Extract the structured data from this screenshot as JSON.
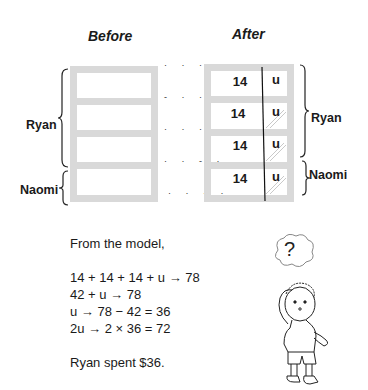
{
  "headings": {
    "before": "Before",
    "after": "After"
  },
  "before_model": {
    "labels": {
      "ryan": "Ryan",
      "naomi": "Naomi"
    },
    "unit_count": 4
  },
  "after_model": {
    "rows": [
      {
        "value": "14",
        "unit": "u",
        "shaded": false
      },
      {
        "value": "14",
        "unit": "u",
        "shaded": true
      },
      {
        "value": "14",
        "unit": "u",
        "shaded": true
      },
      {
        "value": "14",
        "unit": "u",
        "shaded": true
      }
    ],
    "labels": {
      "ryan": "Ryan",
      "naomi": "Naomi"
    }
  },
  "solution": {
    "intro": "From the model,",
    "steps": [
      "14 + 14 + 14 + u → 78",
      "42 + u → 78",
      "u → 78 − 42 = 36",
      "2u → 2 × 36 = 72"
    ],
    "answer": "Ryan spent $36."
  },
  "character": {
    "thought_symbol": "?"
  }
}
